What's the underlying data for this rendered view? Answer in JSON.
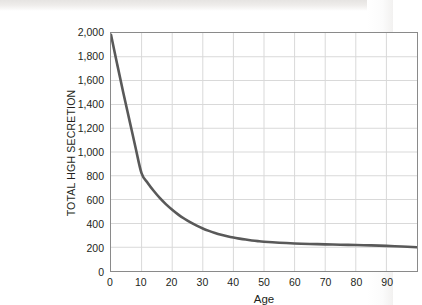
{
  "chart_data": {
    "type": "line",
    "title": "",
    "subtitle": "",
    "xlabel": "Age",
    "ylabel": "TOTAL HGH SECRETION",
    "xlim": [
      0,
      100
    ],
    "ylim": [
      0,
      2000
    ],
    "xticks": [
      0,
      10,
      20,
      30,
      40,
      50,
      60,
      70,
      80,
      90
    ],
    "xticklabels": [
      "0",
      "10",
      "20",
      "30",
      "40",
      "50",
      "60",
      "70",
      "80",
      "90"
    ],
    "yticks": [
      0,
      200,
      400,
      600,
      800,
      1000,
      1200,
      1400,
      1600,
      1800,
      2000
    ],
    "yticklabels": [
      "0",
      "200",
      "400",
      "600",
      "800",
      "1,000",
      "1,200",
      "1,400",
      "1,600",
      "1,800",
      "2,000"
    ],
    "grid": true,
    "grid_color": "#d9d9d9",
    "legend": false,
    "legend_position": "none",
    "line_color": "#595959",
    "line_width": 2.6,
    "series": [
      {
        "name": "Total HGH secretion",
        "x": [
          0,
          2,
          4,
          6,
          8,
          10,
          12,
          14,
          16,
          18,
          20,
          22,
          24,
          26,
          28,
          30,
          32,
          34,
          36,
          38,
          40,
          42,
          44,
          46,
          48,
          50,
          55,
          60,
          65,
          70,
          75,
          80,
          85,
          90,
          95,
          100
        ],
        "values": [
          1985,
          1740,
          1500,
          1270,
          1040,
          820,
          740,
          672,
          612,
          560,
          515,
          474,
          439,
          408,
          381,
          357,
          337,
          320,
          305,
          292,
          281,
          272,
          264,
          257,
          251,
          246,
          237,
          231,
          227,
          224,
          221,
          218,
          215,
          211,
          206,
          200
        ]
      }
    ]
  },
  "axes": {
    "plot_border_color": "#8a8a8a",
    "background": "#ffffff"
  }
}
